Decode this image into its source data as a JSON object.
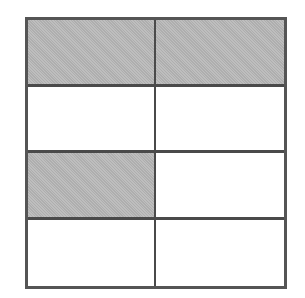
{
  "diagram": {
    "type": "fraction-grid",
    "rows": 4,
    "columns": 2,
    "total_cells": 8,
    "shaded_count": 3,
    "colors": {
      "shaded_fill": "#b9b9b9",
      "unshaded_fill": "#ffffff",
      "line": "#4a4a4a"
    },
    "cells": [
      {
        "row": 0,
        "col": 0,
        "shaded": true
      },
      {
        "row": 0,
        "col": 1,
        "shaded": true
      },
      {
        "row": 1,
        "col": 0,
        "shaded": false
      },
      {
        "row": 1,
        "col": 1,
        "shaded": false
      },
      {
        "row": 2,
        "col": 0,
        "shaded": true
      },
      {
        "row": 2,
        "col": 1,
        "shaded": false
      },
      {
        "row": 3,
        "col": 0,
        "shaded": false
      },
      {
        "row": 3,
        "col": 1,
        "shaded": false
      }
    ]
  }
}
